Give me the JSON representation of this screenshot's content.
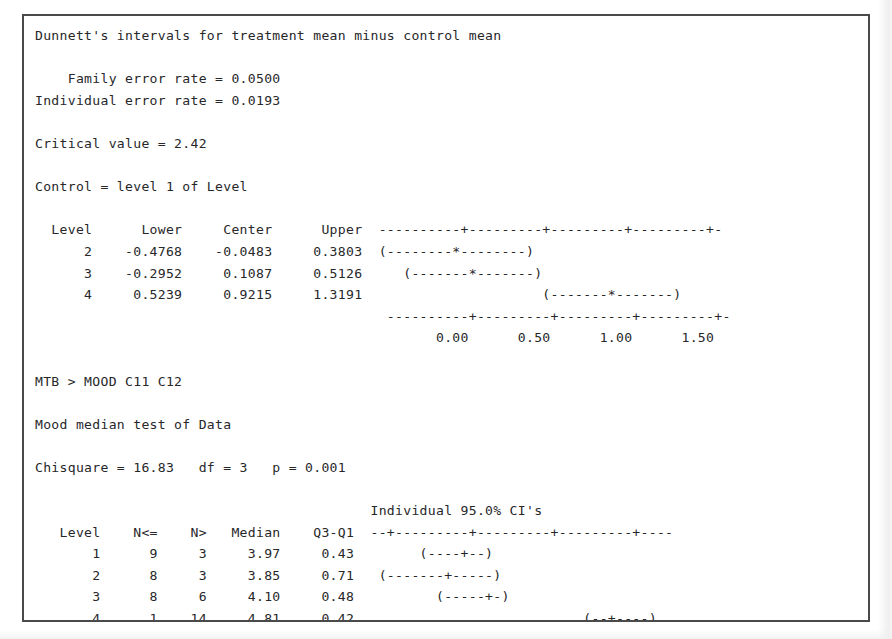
{
  "window": {
    "title": "Minitab Session Output"
  },
  "dunnett": {
    "heading": "Dunnett's intervals for treatment mean minus control mean",
    "family_error_label": "Family error rate =",
    "family_error_value": "0.0500",
    "individual_error_label": "Individual error rate =",
    "individual_error_value": "0.0193",
    "critical_value_label": "Critical value =",
    "critical_value": "2.42",
    "control_line": "Control = level 1 of Level",
    "columns": [
      "Level",
      "Lower",
      "Center",
      "Upper"
    ],
    "rows": [
      {
        "level": "2",
        "lower": "-0.4768",
        "center": "-0.0483",
        "upper": "0.3803"
      },
      {
        "level": "3",
        "lower": "-0.2952",
        "center": "0.1087",
        "upper": "0.5126"
      },
      {
        "level": "4",
        "lower": "0.5239",
        "center": "0.9215",
        "upper": "1.3191"
      }
    ],
    "axis_ticks": [
      "0.00",
      "0.50",
      "1.00",
      "1.50"
    ],
    "axis_rule": "----------+---------+---------+---------+-",
    "interval_plot_rows": [
      "(--------*--------)",
      "   (-------*-------)",
      "                      (-------*-------)"
    ]
  },
  "mood": {
    "prompt_line": "MTB > MOOD C11 C12",
    "heading": "Mood median test of Data",
    "chisquare_label": "Chisquare =",
    "chisquare_value": "16.83",
    "df_label": "df =",
    "df_value": "3",
    "p_label": "p =",
    "p_value": "0.001",
    "ci_title": "Individual 95.0% CI's",
    "columns": [
      "Level",
      "N<=",
      "N>",
      "Median",
      "Q3-Q1"
    ],
    "rows": [
      {
        "level": "1",
        "n_le": "9",
        "n_gt": "3",
        "median": "3.97",
        "iqr": "0.43"
      },
      {
        "level": "2",
        "n_le": "8",
        "n_gt": "3",
        "median": "3.85",
        "iqr": "0.71"
      },
      {
        "level": "3",
        "n_le": "8",
        "n_gt": "6",
        "median": "4.10",
        "iqr": "0.48"
      },
      {
        "level": "4",
        "n_le": "1",
        "n_gt": "14",
        "median": "4.81",
        "iqr": "0.42"
      }
    ],
    "axis_rule": "--+---------+---------+---------+----",
    "axis_ticks": [
      "3.50",
      "4.00",
      "4.50",
      "5.00"
    ],
    "interval_plot_rows": [
      "      (----+--)",
      " (-------+-----)",
      "        (-----+-)",
      "                          (--+----)"
    ],
    "overall_median_label": "Overall median =",
    "overall_median_value": "4.12"
  },
  "chart_data": [
    {
      "type": "errorbar",
      "title": "Dunnett's intervals for treatment mean minus control mean",
      "xlabel": "",
      "ylabel": "Level",
      "categories": [
        "2",
        "3",
        "4"
      ],
      "center": [
        -0.0483,
        0.1087,
        0.9215
      ],
      "lower": [
        -0.4768,
        -0.2952,
        0.5239
      ],
      "upper": [
        0.3803,
        0.5126,
        1.3191
      ],
      "xlim": [
        -0.5,
        1.65
      ],
      "xticks": [
        0.0,
        0.5,
        1.0,
        1.5
      ],
      "xticklabels": [
        "0.00",
        "0.50",
        "1.00",
        "1.50"
      ],
      "grid": false,
      "legend": null,
      "annotations": [
        "Family error rate = 0.0500",
        "Individual error rate = 0.0193",
        "Critical value = 2.42",
        "Control = level 1 of Level"
      ]
    },
    {
      "type": "errorbar",
      "title": "Individual 95.0% CI's",
      "xlabel": "",
      "ylabel": "Level",
      "categories": [
        "1",
        "2",
        "3",
        "4"
      ],
      "median": [
        3.97,
        3.85,
        4.1,
        4.81
      ],
      "iqr": [
        0.43,
        0.71,
        0.48,
        0.42
      ],
      "n_le": [
        9,
        8,
        8,
        1
      ],
      "n_gt": [
        3,
        3,
        6,
        14
      ],
      "xlim": [
        3.35,
        5.2
      ],
      "xticks": [
        3.5,
        4.0,
        4.5,
        5.0
      ],
      "xticklabels": [
        "3.50",
        "4.00",
        "4.50",
        "5.00"
      ],
      "grid": false,
      "legend": null,
      "annotations": [
        "Mood median test of Data",
        "Chisquare = 16.83   df = 3   p = 0.001",
        "Overall median = 4.12"
      ]
    }
  ],
  "session_text": "Dunnett's intervals for treatment mean minus control mean\n\n    Family error rate = 0.0500\nIndividual error rate = 0.0193\n\nCritical value = 2.42\n\nControl = level 1 of Level\n\n  Level      Lower     Center      Upper  ----------+---------+---------+---------+-\n      2    -0.4768    -0.0483     0.3803  (--------*--------)\n      3    -0.2952     0.1087     0.5126     (-------*-------)\n      4     0.5239     0.9215     1.3191                      (-------*-------)\n                                           ----------+---------+---------+---------+-\n                                                 0.00      0.50      1.00      1.50\n\nMTB > MOOD C11 C12\n\nMood median test of Data\n\nChisquare = 16.83   df = 3   p = 0.001\n\n                                         Individual 95.0% CI's\n   Level    N<=    N>   Median    Q3-Q1  --+---------+---------+---------+----\n       1      9     3     3.97     0.43        (----+--)\n       2      8     3     3.85     0.71   (-------+-----)\n       3      8     6     4.10     0.48          (-----+-)\n       4      1    14     4.81     0.42                            (--+----)\n                                         --+---------+---------+---------+----\n                                      3.50      4.00      4.50      5.00\n\nOverall median = 4.12"
}
